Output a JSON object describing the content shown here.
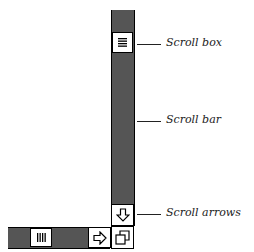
{
  "diagram": {
    "labels": {
      "scroll_box": "Scroll box",
      "scroll_bar": "Scroll bar",
      "scroll_arrows": "Scroll arrows"
    },
    "icons": {
      "vertical_thumb": "horizontal-lines-icon",
      "horizontal_thumb": "vertical-lines-icon",
      "down_arrow": "down-arrow-icon",
      "right_arrow": "right-arrow-icon",
      "size_box": "resize-icon"
    },
    "colors": {
      "line": "#000000",
      "pattern": "#555555",
      "background": "#ffffff"
    }
  }
}
